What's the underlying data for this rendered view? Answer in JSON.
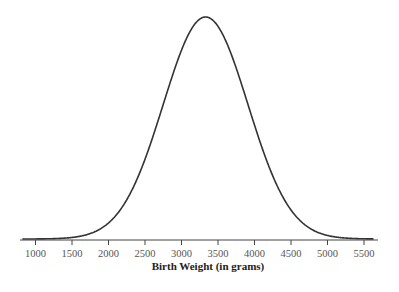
{
  "chart_data": {
    "type": "line",
    "title": "",
    "xlabel": "Birth Weight (in grams)",
    "ylabel": "",
    "xlim": [
      790,
      5700
    ],
    "ylim": [
      0,
      1
    ],
    "grid": false,
    "legend": null,
    "x_ticks": [
      1000,
      1500,
      2000,
      2500,
      3000,
      3500,
      4000,
      4500,
      5000,
      5500
    ],
    "x_tick_labels": [
      "1000",
      "1500",
      "2000",
      "2500",
      "3000",
      "3500",
      "4000",
      "4500",
      "5000",
      "5500"
    ],
    "distribution": {
      "kind": "normal",
      "mean": 3330,
      "sd": 580
    },
    "series": [
      {
        "name": "Birth weight density",
        "x": [
          1000,
          1250,
          1500,
          1750,
          2000,
          2250,
          2500,
          2750,
          3000,
          3250,
          3330,
          3500,
          3750,
          4000,
          4250,
          4500,
          4750,
          5000,
          5250,
          5500
        ],
        "values": [
          0.0,
          0.002,
          0.007,
          0.024,
          0.072,
          0.177,
          0.359,
          0.606,
          0.85,
          0.99,
          1.0,
          0.958,
          0.77,
          0.513,
          0.284,
          0.131,
          0.05,
          0.016,
          0.004,
          0.001
        ]
      }
    ],
    "colors": {
      "curve": "#333333",
      "axis": "#444444",
      "tick_label": "#555555",
      "axis_label": "#222222"
    }
  }
}
